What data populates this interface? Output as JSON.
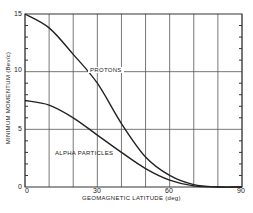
{
  "chart_data": {
    "type": "line",
    "title": "",
    "xlabel": "GEOMAGNETIC LATITUDE (deg)",
    "ylabel": "MINIMUM MOMENTUM (Bev/c)",
    "xlim": [
      0,
      90
    ],
    "ylim": [
      0,
      15
    ],
    "x_ticks": [
      "0",
      "30",
      "60",
      "90"
    ],
    "y_ticks": [
      "0",
      "5",
      "10",
      "15"
    ],
    "grid": true,
    "x": [
      0,
      10,
      20,
      30,
      40,
      50,
      60,
      70,
      80,
      90
    ],
    "series": [
      {
        "name": "PROTONS",
        "values": [
          15,
          13.8,
          11.5,
          9,
          5.5,
          2.6,
          1.0,
          0.2,
          0,
          0
        ]
      },
      {
        "name": "ALPHA PARTICLES",
        "values": [
          7.5,
          7.1,
          6.0,
          4.5,
          3.0,
          1.6,
          0.6,
          0.1,
          0,
          0
        ]
      }
    ],
    "annotations": [
      "PROTONS",
      "ALPHA PARTICLES"
    ]
  }
}
